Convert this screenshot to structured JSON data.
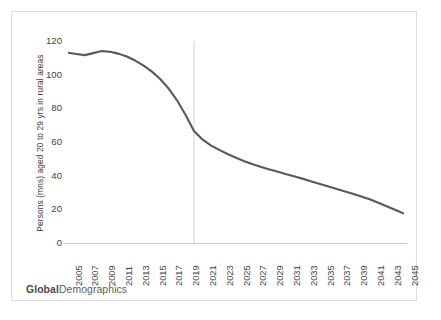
{
  "chart_data": {
    "type": "line",
    "title": "",
    "xlabel": "",
    "ylabel": "Persons (mns) aged 20 to 29 yrs in rural areas",
    "xlim": [
      2005,
      2045
    ],
    "ylim": [
      0,
      120
    ],
    "grid": false,
    "legend": null,
    "line_color": "#595959",
    "tick_labels": {
      "y": [
        "0",
        "20",
        "40",
        "60",
        "80",
        "100",
        "120"
      ],
      "x": [
        "2005",
        "2007",
        "2009",
        "2011",
        "2013",
        "2015",
        "2017",
        "2019",
        "2021",
        "2023",
        "2025",
        "2027",
        "2029",
        "2031",
        "2033",
        "2035",
        "2037",
        "2039",
        "2041",
        "2043",
        "2045"
      ]
    },
    "y_ticks": [
      0,
      20,
      40,
      60,
      80,
      100,
      120
    ],
    "x_ticks": [
      2005,
      2007,
      2009,
      2011,
      2013,
      2015,
      2017,
      2019,
      2021,
      2023,
      2025,
      2027,
      2029,
      2031,
      2033,
      2035,
      2037,
      2039,
      2041,
      2043,
      2045
    ],
    "x": [
      2005,
      2006,
      2007,
      2008,
      2009,
      2010,
      2011,
      2012,
      2013,
      2014,
      2015,
      2016,
      2017,
      2018,
      2019,
      2020,
      2021,
      2022,
      2023,
      2024,
      2025,
      2026,
      2027,
      2028,
      2029,
      2030,
      2031,
      2032,
      2033,
      2034,
      2035,
      2036,
      2037,
      2038,
      2039,
      2040,
      2041,
      2042,
      2043,
      2044,
      2045
    ],
    "series": [
      {
        "name": "Persons aged 20 to 29 yrs in rural areas",
        "values": [
          113.0,
          112.3,
          111.6,
          112.8,
          114.0,
          113.6,
          112.5,
          110.8,
          108.4,
          105.4,
          101.8,
          97.3,
          91.6,
          84.6,
          76.0,
          66.5,
          61.5,
          58.0,
          55.3,
          52.9,
          50.6,
          48.6,
          46.8,
          45.2,
          43.7,
          42.3,
          40.9,
          39.5,
          38.1,
          36.6,
          35.1,
          33.6,
          32.1,
          30.6,
          29.1,
          27.5,
          25.8,
          23.8,
          21.7,
          19.6,
          17.5
        ]
      }
    ],
    "annotations": [
      {
        "type": "vertical-line",
        "name": "forecast-divider",
        "x": 2020,
        "color": "#d0d0d0",
        "label": ""
      }
    ]
  },
  "footer": {
    "brand_strong": "Global",
    "brand_light": "Demographics"
  }
}
